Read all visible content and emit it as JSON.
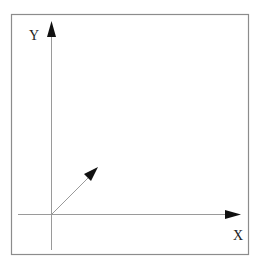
{
  "diagram": {
    "type": "coordinate-axes",
    "axes": {
      "x": {
        "label": "X"
      },
      "y": {
        "label": "Y"
      }
    },
    "vector": {
      "description": "arrow from origin pointing up-right"
    },
    "colors": {
      "frame": "#8c8c8c",
      "axis": "#9a9a9a",
      "arrowhead": "#111111",
      "text": "#222222"
    }
  }
}
